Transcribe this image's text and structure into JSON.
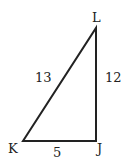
{
  "diagram": {
    "type": "right-triangle",
    "vertices": [
      {
        "name": "L",
        "x": 96,
        "y": 28
      },
      {
        "name": "J",
        "x": 96,
        "y": 141
      },
      {
        "name": "K",
        "x": 23,
        "y": 141
      }
    ],
    "sides": {
      "KL": "13",
      "LJ": "12",
      "KJ": "5"
    },
    "labels": {
      "L": "L",
      "K": "K",
      "J": "J"
    },
    "stroke_color": "#222222"
  }
}
